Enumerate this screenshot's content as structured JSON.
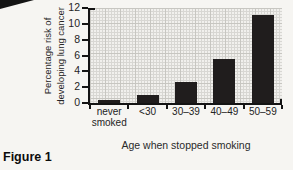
{
  "figure_label": "Figure 1",
  "chart_data": {
    "type": "bar",
    "categories": [
      "never\nsmoked",
      "<30",
      "30–39",
      "40–49",
      "50–59"
    ],
    "values": [
      0.4,
      1.0,
      2.7,
      5.6,
      11.1
    ],
    "title": "",
    "xlabel": "Age when stopped smoking",
    "ylabel": "Percentage risk of\ndeveloping lung cancer",
    "ylim": [
      0,
      12
    ],
    "yticks": [
      0,
      2,
      4,
      6,
      8,
      10,
      12
    ],
    "legend": "none",
    "grid": "graph-paper minor+major gridlines",
    "bar_color": "#201d1d",
    "axis_color": "#141414",
    "plot_background": "#f1f0ed"
  }
}
